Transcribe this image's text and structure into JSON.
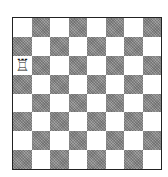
{
  "board": {
    "size": 8,
    "light_color": "#ffffff",
    "dark_color": "#8a8a8a",
    "top_left": "light",
    "pieces": [
      {
        "square": "a6",
        "row": 2,
        "col": 0,
        "type": "rook",
        "color": "white",
        "glyph": "♖"
      }
    ]
  }
}
